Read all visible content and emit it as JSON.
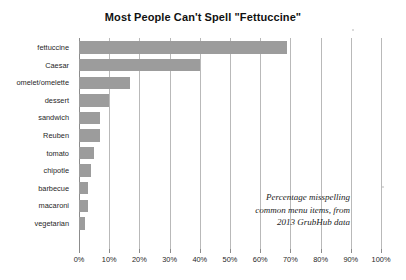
{
  "chart_data": {
    "type": "bar",
    "orientation": "horizontal",
    "title": "Most People Can't Spell \"Fettuccine\"",
    "xlabel": "",
    "ylabel": "",
    "xlim": [
      0,
      100
    ],
    "grid": "vertical",
    "legend": "none",
    "categories": [
      "fettuccine",
      "Caesar",
      "omelet/omelette",
      "dessert",
      "sandwich",
      "Reuben",
      "tomato",
      "chipotle",
      "barbecue",
      "macaroni",
      "vegetarian"
    ],
    "values": [
      69,
      40,
      17,
      10,
      7,
      7,
      5,
      4,
      3,
      3,
      2
    ],
    "xticks": [
      0,
      10,
      20,
      30,
      40,
      50,
      60,
      70,
      80,
      90,
      100
    ],
    "xtick_labels": [
      "0%",
      "10%",
      "20%",
      "30%",
      "40%",
      "50%",
      "60%",
      "70%",
      "80%",
      "90%",
      "100%"
    ],
    "annotation": [
      "Percentage misspelling",
      "common menu items, from",
      "2013 GrubHub data"
    ],
    "colors": {
      "bar": "#9c9c9c",
      "gridline": "#b9b9b9",
      "axis": "#8c8c8c",
      "text": "#1f1f1f",
      "background": "#ffffff"
    }
  }
}
